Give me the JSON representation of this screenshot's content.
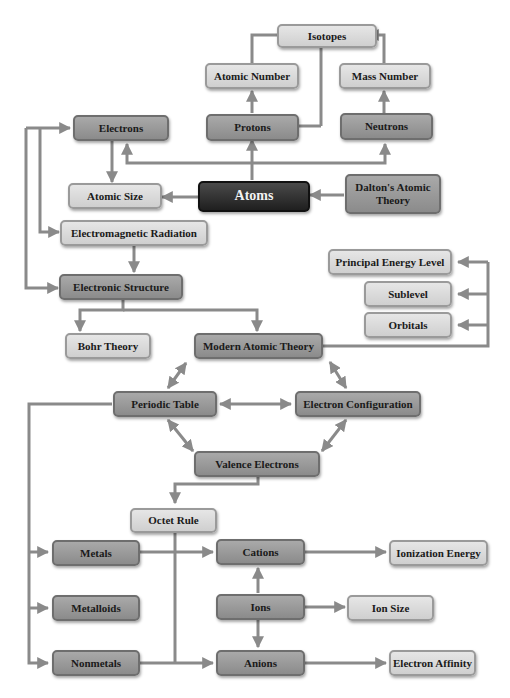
{
  "diagram": {
    "colors": {
      "line": "#8a8a8a",
      "light_box": "#d9d9d9",
      "mid_box": "#999999",
      "dark_box": "#2e2e2e"
    },
    "nodes": {
      "isotopes": "Isotopes",
      "atomic_number": "Atomic Number",
      "mass_number": "Mass Number",
      "electrons": "Electrons",
      "protons": "Protons",
      "neutrons": "Neutrons",
      "atomic_size": "Atomic Size",
      "atoms": "Atoms",
      "daltons_theory": "Dalton's Atomic Theory",
      "em_radiation": "Electromagnetic Radiation",
      "electronic_structure": "Electronic Structure",
      "principal_energy_level": "Principal Energy Level",
      "sublevel": "Sublevel",
      "orbitals": "Orbitals",
      "bohr_theory": "Bohr Theory",
      "modern_atomic_theory": "Modern Atomic Theory",
      "periodic_table": "Periodic Table",
      "electron_configuration": "Electron Configuration",
      "valence_electrons": "Valence Electrons",
      "octet_rule": "Octet Rule",
      "metals": "Metals",
      "cations": "Cations",
      "ionization_energy": "Ionization Energy",
      "metalloids": "Metalloids",
      "ions": "Ions",
      "ion_size": "Ion Size",
      "nonmetals": "Nonmetals",
      "anions": "Anions",
      "electron_affinity": "Electron Affinity"
    }
  }
}
